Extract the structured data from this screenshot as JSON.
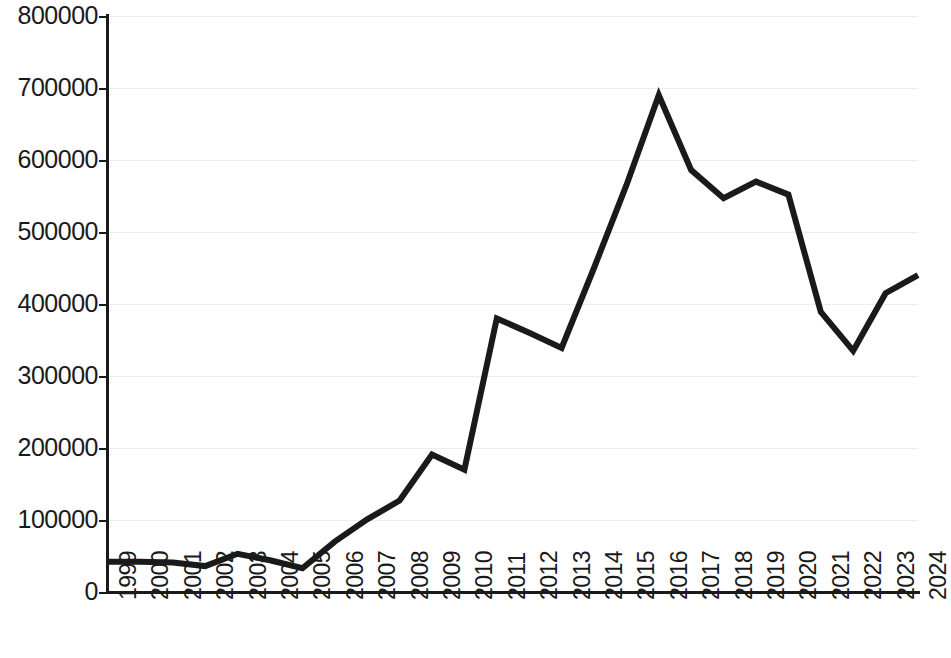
{
  "chart_data": {
    "type": "line",
    "title": "",
    "subtitle": "",
    "xlabel": "",
    "ylabel": "",
    "grid": true,
    "legend": false,
    "legend_position": "none",
    "line_color": "#1a1a1a",
    "background_color": "#ffffff",
    "gridline_color": "#ededed",
    "xlim": [
      "1999",
      "2024"
    ],
    "ylim": [
      0,
      800000
    ],
    "ytick_step": 100000,
    "ytick_labels": [
      "0",
      "100000",
      "200000",
      "300000",
      "400000",
      "500000",
      "600000",
      "700000",
      "800000"
    ],
    "ytick_values": [
      0,
      100000,
      200000,
      300000,
      400000,
      500000,
      600000,
      700000,
      800000
    ],
    "categories": [
      "1999",
      "2000",
      "2001",
      "2002",
      "2003",
      "2004",
      "2005",
      "2006",
      "2007",
      "2008",
      "2009",
      "2010",
      "2011",
      "2012",
      "2013",
      "2014",
      "2015",
      "2016",
      "2017",
      "2018",
      "2019",
      "2020",
      "2021",
      "2022",
      "2023",
      "2024"
    ],
    "values": [
      42000,
      42000,
      41000,
      36000,
      53000,
      44000,
      33000,
      70000,
      101000,
      127000,
      191000,
      170000,
      380000,
      360000,
      339000,
      450000,
      565000,
      690000,
      586000,
      547000,
      570000,
      552000,
      389000,
      335000,
      415000,
      440000
    ],
    "series": [
      {
        "name": "series-1",
        "color": "#1a1a1a",
        "line_width": 6,
        "marker": "none",
        "values": [
          42000,
          42000,
          41000,
          36000,
          53000,
          44000,
          33000,
          70000,
          101000,
          127000,
          191000,
          170000,
          380000,
          360000,
          339000,
          450000,
          565000,
          690000,
          586000,
          547000,
          570000,
          552000,
          389000,
          335000,
          415000,
          440000
        ]
      }
    ]
  }
}
